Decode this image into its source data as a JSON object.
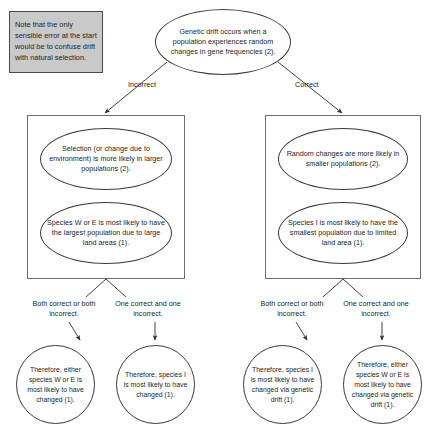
{
  "diagram": {
    "note": {
      "text": "Note that the only sensible error at the start would be to confuse drift with natural selection.",
      "fill_color": "#c9c9c9",
      "border_color": "#4a4a4a"
    },
    "root": {
      "text": "Genetic drift occurs when a population experiences random changes in gene frequencies (2)."
    },
    "branch_labels": {
      "left": "Incorrect",
      "right": "Correct"
    },
    "branches": [
      {
        "id": "incorrect",
        "label": "Incorrect",
        "premises": [
          {
            "text": "Selection (or change due to environment) is more likely in larger populations (2)."
          },
          {
            "text": "Species W or E is most likely to have the largest population due to large land areas (1)."
          }
        ],
        "split_labels": [
          "Both correct or both incorrect.",
          "One correct and one incorrect."
        ],
        "conclusions": [
          {
            "text": "Therefore, either species W or E is most likely to have changed (1)."
          },
          {
            "text": "Therefore, species I is most likely to have changed (1)."
          }
        ]
      },
      {
        "id": "correct",
        "label": "Correct",
        "premises": [
          {
            "text": "Random changes are more likely in smaller populations (2)."
          },
          {
            "text": "Species I is most likely to have the smallest population due to limited land area (1)."
          }
        ],
        "split_labels": [
          "Both correct or both incorrect.",
          "One correct and one incorrect."
        ],
        "conclusions": [
          {
            "text": "Therefore, species I is most likely to have changed via genetic drift (1)."
          },
          {
            "text": "Therefore, either species W or E is most likely to have changed via genetic drift (1)."
          }
        ]
      }
    ],
    "colors": {
      "stroke": "#3a3a3a",
      "box_stroke": "#6d6d6d",
      "text": "#1d1d1d",
      "background": "#ffffff"
    }
  }
}
